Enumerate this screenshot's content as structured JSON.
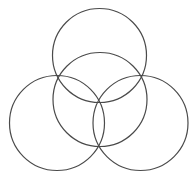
{
  "diagram": {
    "type": "overlapping-circles",
    "background": "#ffffff",
    "stroke_color": "#4a4a4a",
    "circles": [
      {
        "name": "top",
        "cx": 99.5,
        "cy": 55.5,
        "r": 47
      },
      {
        "name": "center",
        "cx": 100,
        "cy": 99.5,
        "r": 47
      },
      {
        "name": "left",
        "cx": 57,
        "cy": 123,
        "r": 47.5
      },
      {
        "name": "right",
        "cx": 140.5,
        "cy": 123,
        "r": 47.5
      }
    ],
    "intersection_points": [
      {
        "x": 58,
        "y": 77
      },
      {
        "x": 142,
        "y": 77
      },
      {
        "x": 98.5,
        "y": 100.5
      },
      {
        "x": 98.5,
        "y": 146
      }
    ]
  }
}
